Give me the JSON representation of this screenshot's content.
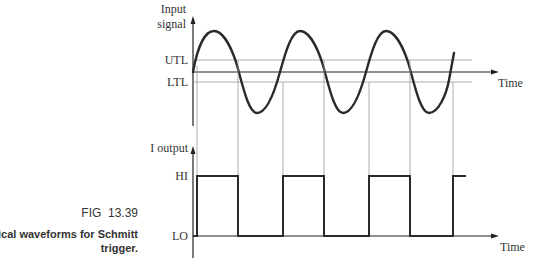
{
  "figure": {
    "number": "FIG  13.39",
    "caption_line1": "Typical waveforms for Schmitt",
    "caption_line2": "trigger."
  },
  "input_graph": {
    "ylabel_line1": "Input",
    "ylabel_line2": "signal",
    "utl_label": "UTL",
    "ltl_label": "LTL",
    "xlabel": "Time"
  },
  "output_graph": {
    "ylabel": "I output",
    "hi_label": "HI",
    "lo_label": "LO",
    "xlabel": "Time"
  },
  "colors": {
    "waveform": "#2a2a2a",
    "threshold_lines": "#9a9a9a",
    "text": "#333333"
  }
}
